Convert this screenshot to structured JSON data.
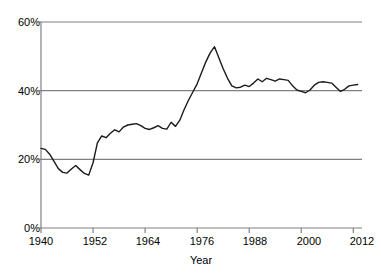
{
  "chart_data": {
    "type": "line",
    "title": "",
    "xlabel": "Year",
    "ylabel": "",
    "xlim": [
      1940,
      2014
    ],
    "ylim": [
      0,
      60
    ],
    "grid": true,
    "legend": "none",
    "line_color": "#1a1a1a",
    "grid_color": "#808080",
    "axis_color": "#808080",
    "xticks": [
      1940,
      1952,
      1964,
      1976,
      1988,
      2000,
      2012
    ],
    "xtick_labels": [
      "1940",
      "1952",
      "1964",
      "1976",
      "1988",
      "2000",
      "2012"
    ],
    "yticks": [
      0,
      20,
      40,
      60
    ],
    "ytick_labels": [
      "0%",
      "20%",
      "40%",
      "60%"
    ],
    "x": [
      1940,
      1941,
      1942,
      1943,
      1944,
      1945,
      1946,
      1947,
      1948,
      1949,
      1950,
      1951,
      1952,
      1953,
      1954,
      1955,
      1956,
      1957,
      1958,
      1959,
      1960,
      1961,
      1962,
      1963,
      1964,
      1965,
      1966,
      1967,
      1968,
      1969,
      1970,
      1971,
      1972,
      1973,
      1974,
      1975,
      1976,
      1977,
      1978,
      1979,
      1980,
      1981,
      1982,
      1983,
      1984,
      1985,
      1986,
      1987,
      1988,
      1989,
      1990,
      1991,
      1992,
      1993,
      1994,
      1995,
      1996,
      1997,
      1998,
      1999,
      2000,
      2001,
      2002,
      2003,
      2004,
      2005,
      2006,
      2007,
      2008,
      2009,
      2010,
      2011,
      2012,
      2013
    ],
    "values": [
      23.2,
      22.9,
      21.5,
      19.4,
      17.3,
      16.2,
      16.0,
      17.2,
      18.2,
      17.0,
      15.9,
      15.4,
      19.0,
      24.8,
      26.8,
      26.3,
      27.6,
      28.6,
      28.0,
      29.4,
      30.0,
      30.2,
      30.4,
      29.8,
      29.0,
      28.7,
      29.2,
      29.8,
      29.0,
      28.8,
      30.8,
      29.6,
      31.4,
      34.5,
      37.2,
      39.6,
      42.0,
      45.2,
      48.4,
      51.0,
      52.8,
      49.6,
      46.4,
      43.6,
      41.4,
      40.8,
      41.0,
      41.6,
      41.2,
      42.2,
      43.4,
      42.6,
      43.6,
      43.2,
      42.8,
      43.4,
      43.2,
      43.0,
      41.4,
      40.2,
      39.8,
      39.4,
      40.2,
      41.6,
      42.4,
      42.6,
      42.4,
      42.2,
      41.0,
      39.8,
      40.4,
      41.4,
      41.6,
      41.8
    ],
    "unit": "%"
  }
}
